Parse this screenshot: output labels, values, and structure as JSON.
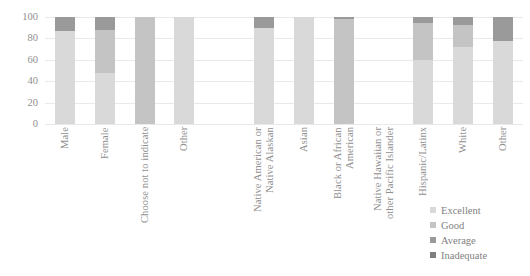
{
  "chart_data": {
    "type": "bar",
    "subtype": "stacked-column-100",
    "title": "",
    "subtitle": "",
    "xlabel": "",
    "ylabel": "",
    "ylim": [
      0,
      100
    ],
    "yticks": [
      0,
      20,
      40,
      60,
      80,
      100
    ],
    "grid": true,
    "legend_position": "right-bottom",
    "legend": [
      "Excellent",
      "Good",
      "Average",
      "Inadequate"
    ],
    "colors": {
      "Excellent": "#d9d9d9",
      "Good": "#c4c4c4",
      "Average": "#9a9a9a",
      "Inadequate": "#7f7f7f",
      "gridline": "#e9e9e9",
      "axis_text": "#8f8f8f"
    },
    "categories": [
      "Male",
      "Female",
      "Choose not to indicate",
      "Other",
      "",
      "Native American or\nNative Alaskan",
      "Asian",
      "Black or African\nAmerican",
      "Native Hawaiian or\nother Pacific Islander",
      "Hispanic/Latinx",
      "White",
      "Other"
    ],
    "series": [
      {
        "name": "Excellent",
        "values": [
          87,
          48,
          0,
          100,
          null,
          90,
          100,
          0,
          null,
          60,
          72,
          78
        ]
      },
      {
        "name": "Good",
        "values": [
          0,
          40,
          100,
          0,
          null,
          0,
          0,
          98,
          null,
          34,
          21,
          0
        ]
      },
      {
        "name": "Average",
        "values": [
          13,
          12,
          0,
          0,
          null,
          10,
          0,
          2,
          null,
          6,
          7,
          22
        ]
      },
      {
        "name": "Inadequate",
        "values": [
          0,
          0,
          0,
          0,
          null,
          0,
          0,
          0,
          null,
          0,
          0,
          0
        ]
      }
    ]
  },
  "legend": {
    "items": [
      {
        "label": "Excellent",
        "color": "#d9d9d9"
      },
      {
        "label": "Good",
        "color": "#c4c4c4"
      },
      {
        "label": "Average",
        "color": "#9a9a9a"
      },
      {
        "label": "Inadequate",
        "color": "#7f7f7f"
      }
    ]
  }
}
